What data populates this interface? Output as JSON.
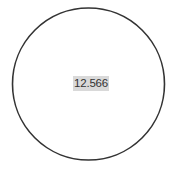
{
  "diagram": {
    "shape": "circle",
    "stroke_color": "#333333",
    "fill_color": "#ffffff",
    "center": {
      "x": 88.5,
      "y": 84
    },
    "radius": 76,
    "label": {
      "text": "12.566",
      "background": "#d9d9d9"
    }
  }
}
